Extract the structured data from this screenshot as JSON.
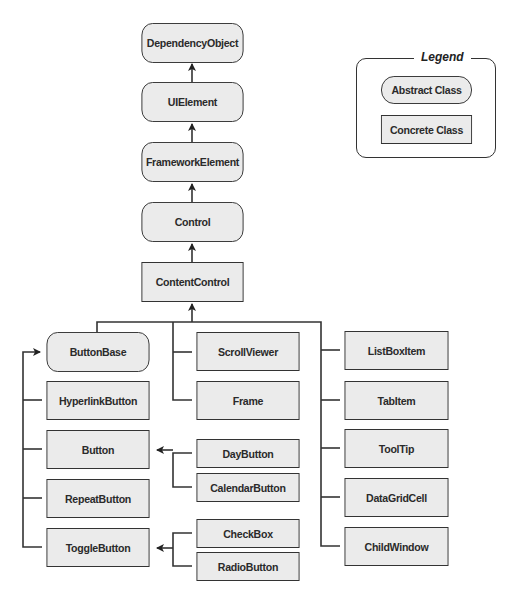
{
  "diagram": {
    "nodes": {
      "dependency_object": {
        "label": "DependencyObject",
        "kind": "abstract"
      },
      "ui_element": {
        "label": "UIElement",
        "kind": "abstract"
      },
      "framework_element": {
        "label": "FrameworkElement",
        "kind": "abstract"
      },
      "control": {
        "label": "Control",
        "kind": "abstract"
      },
      "content_control": {
        "label": "ContentControl",
        "kind": "concrete"
      },
      "button_base": {
        "label": "ButtonBase",
        "kind": "abstract"
      },
      "hyperlink_button": {
        "label": "HyperlinkButton",
        "kind": "concrete"
      },
      "button": {
        "label": "Button",
        "kind": "concrete"
      },
      "repeat_button": {
        "label": "RepeatButton",
        "kind": "concrete"
      },
      "toggle_button": {
        "label": "ToggleButton",
        "kind": "concrete"
      },
      "scroll_viewer": {
        "label": "ScrollViewer",
        "kind": "concrete"
      },
      "frame": {
        "label": "Frame",
        "kind": "concrete"
      },
      "day_button": {
        "label": "DayButton",
        "kind": "concrete"
      },
      "calendar_button": {
        "label": "CalendarButton",
        "kind": "concrete"
      },
      "check_box": {
        "label": "CheckBox",
        "kind": "concrete"
      },
      "radio_button": {
        "label": "RadioButton",
        "kind": "concrete"
      },
      "list_box_item": {
        "label": "ListBoxItem",
        "kind": "concrete"
      },
      "tab_item": {
        "label": "TabItem",
        "kind": "concrete"
      },
      "tool_tip": {
        "label": "ToolTip",
        "kind": "concrete"
      },
      "data_grid_cell": {
        "label": "DataGridCell",
        "kind": "concrete"
      },
      "child_window": {
        "label": "ChildWindow",
        "kind": "concrete"
      }
    },
    "edges": [
      [
        "UIElement",
        "DependencyObject"
      ],
      [
        "FrameworkElement",
        "UIElement"
      ],
      [
        "Control",
        "FrameworkElement"
      ],
      [
        "ContentControl",
        "Control"
      ],
      [
        "ButtonBase",
        "ContentControl"
      ],
      [
        "ScrollViewer",
        "ContentControl"
      ],
      [
        "Frame",
        "ContentControl"
      ],
      [
        "ListBoxItem",
        "ContentControl"
      ],
      [
        "TabItem",
        "ContentControl"
      ],
      [
        "ToolTip",
        "ContentControl"
      ],
      [
        "DataGridCell",
        "ContentControl"
      ],
      [
        "ChildWindow",
        "ContentControl"
      ],
      [
        "HyperlinkButton",
        "ButtonBase"
      ],
      [
        "Button",
        "ButtonBase"
      ],
      [
        "RepeatButton",
        "ButtonBase"
      ],
      [
        "ToggleButton",
        "ButtonBase"
      ],
      [
        "DayButton",
        "Button"
      ],
      [
        "CalendarButton",
        "Button"
      ],
      [
        "CheckBox",
        "ToggleButton"
      ],
      [
        "RadioButton",
        "ToggleButton"
      ]
    ]
  },
  "legend": {
    "title": "Legend",
    "abstract_label": "Abstract Class",
    "concrete_label": "Concrete Class"
  },
  "colors": {
    "box_fill": "#ebebeb",
    "stroke": "#333333"
  }
}
